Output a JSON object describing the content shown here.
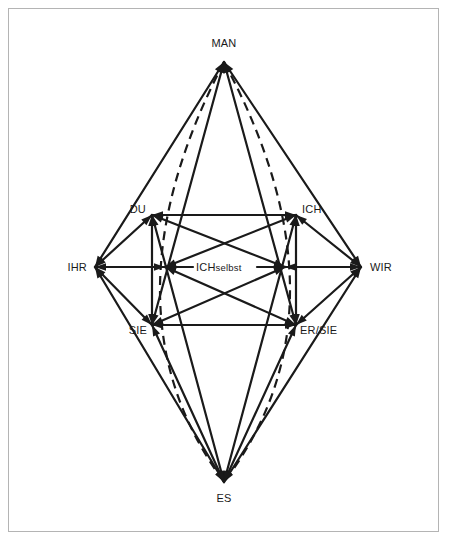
{
  "figure": {
    "kind": "relationship-diagram",
    "shape": "bipyramid-hexagon",
    "background_color": "#ffffff",
    "frame_color": "#b4b4b4",
    "line_color": "#1a1a1a"
  },
  "nodes": {
    "man": {
      "label": "MAN",
      "x": 224,
      "y": 62,
      "label_x": 224,
      "label_y": 47,
      "anchor": "middle"
    },
    "es": {
      "label": "ES",
      "x": 224,
      "y": 482,
      "label_x": 224,
      "label_y": 502,
      "anchor": "middle"
    },
    "ihr": {
      "label": "IHR",
      "x": 95,
      "y": 267,
      "label_x": 87,
      "label_y": 271,
      "anchor": "end"
    },
    "wir": {
      "label": "WIR",
      "x": 361,
      "y": 267,
      "label_x": 370,
      "label_y": 271,
      "anchor": "start"
    },
    "du": {
      "label": "DU",
      "x": 152,
      "y": 215,
      "label_x": 146,
      "label_y": 213,
      "anchor": "end"
    },
    "ich": {
      "label": "ICH",
      "x": 296,
      "y": 215,
      "label_x": 302,
      "label_y": 213,
      "anchor": "start"
    },
    "sie": {
      "label": "SIE",
      "x": 152,
      "y": 325,
      "label_x": 147,
      "label_y": 334,
      "anchor": "end"
    },
    "ersie": {
      "label": "ER/SIE",
      "x": 296,
      "y": 325,
      "label_x": 300,
      "label_y": 334,
      "anchor": "start"
    },
    "mid_left": {
      "label": "",
      "x": 165,
      "y": 267
    },
    "mid_right": {
      "label": "",
      "x": 285,
      "y": 267
    }
  },
  "center_label": {
    "main": "ICH",
    "suffix": "selbst",
    "full": "ICHselbst",
    "x": 196,
    "y": 271
  },
  "edges_solid": [
    {
      "name": "man-ihr",
      "x1": 224,
      "y1": 62,
      "x2": 95,
      "y2": 267
    },
    {
      "name": "man-wir",
      "x1": 224,
      "y1": 62,
      "x2": 361,
      "y2": 267
    },
    {
      "name": "man-sie",
      "x1": 224,
      "y1": 62,
      "x2": 152,
      "y2": 325
    },
    {
      "name": "man-ersie",
      "x1": 224,
      "y1": 62,
      "x2": 296,
      "y2": 325
    },
    {
      "name": "es-ihr",
      "x1": 224,
      "y1": 482,
      "x2": 95,
      "y2": 267
    },
    {
      "name": "es-wir",
      "x1": 224,
      "y1": 482,
      "x2": 361,
      "y2": 267
    },
    {
      "name": "es-du",
      "x1": 224,
      "y1": 482,
      "x2": 152,
      "y2": 215
    },
    {
      "name": "es-ich",
      "x1": 224,
      "y1": 482,
      "x2": 296,
      "y2": 215
    },
    {
      "name": "es-sie",
      "x1": 224,
      "y1": 482,
      "x2": 152,
      "y2": 325
    },
    {
      "name": "es-ersie",
      "x1": 224,
      "y1": 482,
      "x2": 296,
      "y2": 325
    },
    {
      "name": "du-ich",
      "x1": 152,
      "y1": 215,
      "x2": 296,
      "y2": 215
    },
    {
      "name": "sie-ersie",
      "x1": 152,
      "y1": 325,
      "x2": 296,
      "y2": 325
    },
    {
      "name": "ihr-du",
      "x1": 95,
      "y1": 267,
      "x2": 152,
      "y2": 215
    },
    {
      "name": "ihr-sie",
      "x1": 95,
      "y1": 267,
      "x2": 152,
      "y2": 325
    },
    {
      "name": "wir-ich",
      "x1": 361,
      "y1": 267,
      "x2": 296,
      "y2": 215
    },
    {
      "name": "wir-ersie",
      "x1": 361,
      "y1": 267,
      "x2": 296,
      "y2": 325
    },
    {
      "name": "ihr-midleft",
      "x1": 95,
      "y1": 267,
      "x2": 165,
      "y2": 267
    },
    {
      "name": "wir-midright",
      "x1": 361,
      "y1": 267,
      "x2": 285,
      "y2": 267
    },
    {
      "name": "midleft-center",
      "x1": 165,
      "y1": 267,
      "x2": 193,
      "y2": 267
    },
    {
      "name": "midright-center",
      "x1": 285,
      "y1": 267,
      "x2": 257,
      "y2": 267
    },
    {
      "name": "du-midright",
      "x1": 152,
      "y1": 215,
      "x2": 285,
      "y2": 267
    },
    {
      "name": "ich-midleft",
      "x1": 296,
      "y1": 215,
      "x2": 165,
      "y2": 267
    },
    {
      "name": "sie-midright",
      "x1": 152,
      "y1": 325,
      "x2": 285,
      "y2": 267
    },
    {
      "name": "ersie-midleft",
      "x1": 296,
      "y1": 325,
      "x2": 165,
      "y2": 267
    },
    {
      "name": "du-sie",
      "x1": 152,
      "y1": 215,
      "x2": 152,
      "y2": 325
    },
    {
      "name": "ich-ersie",
      "x1": 296,
      "y1": 215,
      "x2": 296,
      "y2": 325
    }
  ],
  "edges_dashed": [
    {
      "name": "man-es-left",
      "x1": 224,
      "y1": 62,
      "x2": 224,
      "y2": 482,
      "via_x": 160,
      "via_y": 290
    },
    {
      "name": "man-es-right",
      "x1": 224,
      "y1": 62,
      "x2": 224,
      "y2": 482,
      "via_x": 290,
      "via_y": 290
    }
  ],
  "arrow_targets": [
    "du",
    "ich",
    "sie",
    "ersie",
    "ihr",
    "wir",
    "man",
    "es",
    "mid_left",
    "mid_right"
  ]
}
